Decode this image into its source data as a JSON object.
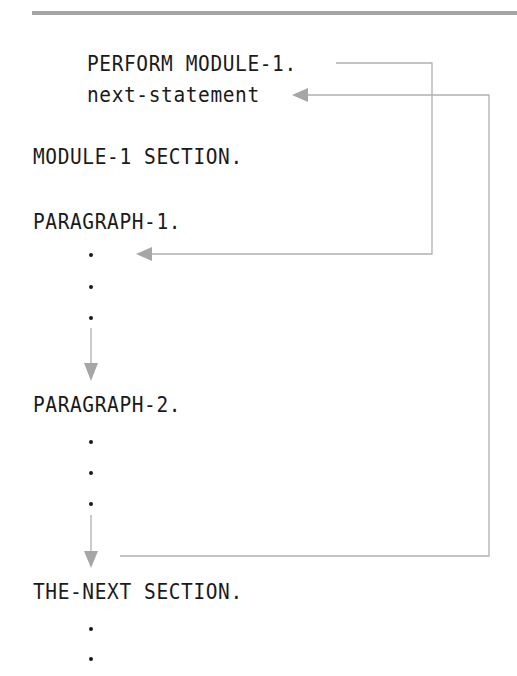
{
  "diagram": {
    "type": "cobol-perform-section-flow",
    "lines": {
      "perform": "PERFORM MODULE-1.",
      "next_statement": "next-statement",
      "module_section": "MODULE-1 SECTION.",
      "paragraph_1": "PARAGRAPH-1.",
      "paragraph_2": "PARAGRAPH-2.",
      "next_section": "THE-NEXT SECTION."
    },
    "ellipsis_dots": {
      "paragraph_1": 3,
      "paragraph_2": 3,
      "next_section": 2
    },
    "arrows": [
      {
        "from": "PERFORM MODULE-1.",
        "to": "PARAGRAPH-1 first statement",
        "style": "elbow"
      },
      {
        "from": "PARAGRAPH-1 end",
        "to": "PARAGRAPH-2.",
        "style": "vertical"
      },
      {
        "from": "PARAGRAPH-2 end",
        "to": "THE-NEXT SECTION.",
        "style": "vertical"
      },
      {
        "from": "end of MODULE-1 SECTION",
        "to": "next-statement",
        "style": "elbow"
      }
    ],
    "colors": {
      "text": "#1a1a1a",
      "arrow": "#a6a6a6",
      "rule": "#a6a6a6"
    }
  }
}
